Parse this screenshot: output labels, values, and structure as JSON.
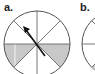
{
  "panels": [
    {
      "label": "a.",
      "description": "circle divided into 8 sectors, two lower sectors adjacent to horizontal diameter shaded, arrow pointing up-left from center"
    },
    {
      "label": "b.",
      "description": "second circle partially visible"
    }
  ],
  "colors": {
    "line": "#555555",
    "shade": "#c8c8c8",
    "arrow": "#111111",
    "text": "#222222"
  }
}
